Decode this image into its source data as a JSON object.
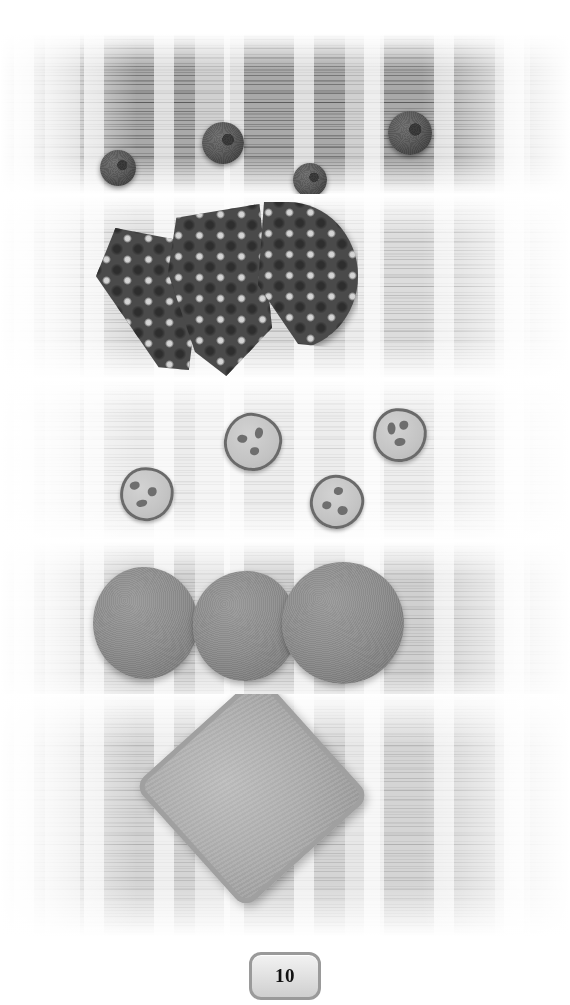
{
  "page": {
    "number": "10",
    "background_color": "#ffffff",
    "width": 570,
    "height": 1005
  },
  "badge": {
    "label": "10",
    "border_color": "#9a9a9a",
    "fill_color": "#e3e3e3",
    "text_color": "#111111"
  },
  "photos": [
    {
      "name": "pom-poms-on-dark-wood",
      "caption": "",
      "surface_color": "#a9a9a9",
      "items": [
        {
          "kind": "pom-pom",
          "x": 100,
          "y": 116,
          "size": 36,
          "color": "#5a5a5a"
        },
        {
          "kind": "pom-pom",
          "x": 202,
          "y": 88,
          "size": 42,
          "color": "#5a5a5a"
        },
        {
          "kind": "pom-pom",
          "x": 293,
          "y": 129,
          "size": 34,
          "color": "#5a5a5a"
        },
        {
          "kind": "pom-pom",
          "x": 388,
          "y": 77,
          "size": 44,
          "color": "#4f4f4f"
        }
      ]
    },
    {
      "name": "patterned-fabric-wedges",
      "caption": "",
      "surface_color": "#dcdcdc",
      "pattern": "floral-dot",
      "pattern_colors": [
        "#4a4a4a",
        "#d8d8d8",
        "#2e2e2e"
      ],
      "items": [
        {
          "kind": "fabric-wedge-left",
          "x": 96,
          "y": 32,
          "w": 108,
          "h": 142
        },
        {
          "kind": "fabric-wedge-mid",
          "x": 168,
          "y": 8,
          "w": 104,
          "h": 172
        },
        {
          "kind": "fabric-half-circle",
          "x": 258,
          "y": 6,
          "w": 100,
          "h": 148
        }
      ]
    },
    {
      "name": "chip-discs-on-light-wood",
      "caption": "",
      "surface_color": "#ededed",
      "items": [
        {
          "kind": "chip-disc",
          "x": 120,
          "y": 87,
          "size": 48,
          "chips": 3
        },
        {
          "kind": "chip-disc",
          "x": 224,
          "y": 33,
          "size": 52,
          "chips": 3
        },
        {
          "kind": "chip-disc",
          "x": 310,
          "y": 95,
          "size": 48,
          "chips": 3
        },
        {
          "kind": "chip-disc",
          "x": 373,
          "y": 28,
          "size": 48,
          "chips": 3
        }
      ]
    },
    {
      "name": "felt-circles",
      "caption": "",
      "surface_color": "#d0d0d0",
      "items": [
        {
          "kind": "felt-circle",
          "x": 93,
          "y": 25,
          "size": 105,
          "color": "#8e8e8e"
        },
        {
          "kind": "felt-circle",
          "x": 193,
          "y": 29,
          "size": 104,
          "color": "#8e8e8e"
        },
        {
          "kind": "felt-circle",
          "x": 282,
          "y": 20,
          "size": 122,
          "color": "#8e8e8e"
        }
      ]
    },
    {
      "name": "felt-pouch-square",
      "caption": "",
      "surface_color": "#d4d4d4",
      "items": [
        {
          "kind": "felt-pouch",
          "x": 168,
          "y": 14,
          "w": 168,
          "h": 166,
          "rotation": -42,
          "color": "#b2b2b2"
        }
      ]
    }
  ]
}
